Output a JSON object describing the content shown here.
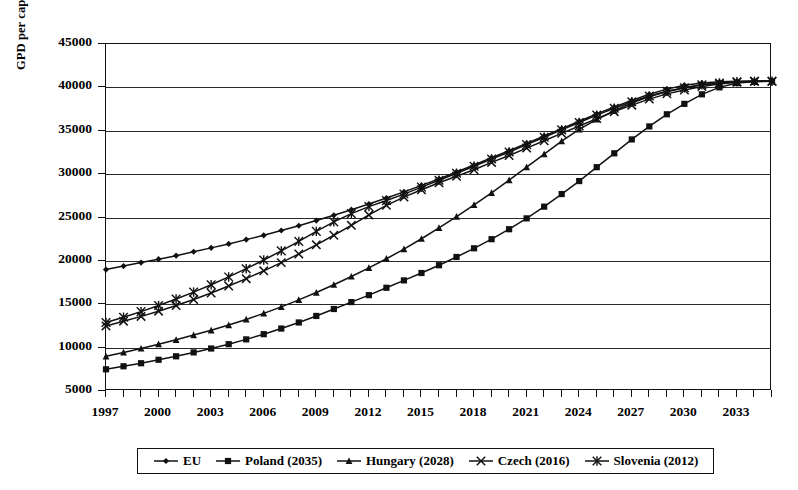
{
  "chart_data": {
    "type": "line",
    "title": "",
    "xlabel": "",
    "ylabel": "GPD per capita at PPP (US$)",
    "ylim": [
      5000,
      45000
    ],
    "xlim": [
      1997,
      2035
    ],
    "ytick_labels": [
      "45000",
      "40000",
      "35000",
      "30000",
      "25000",
      "20000",
      "15000",
      "10000",
      "5000"
    ],
    "ytick_values": [
      45000,
      40000,
      35000,
      30000,
      25000,
      20000,
      15000,
      10000,
      5000
    ],
    "xtick_labels": [
      "1997",
      "2000",
      "2003",
      "2006",
      "2009",
      "2012",
      "2015",
      "2018",
      "2021",
      "2024",
      "2027",
      "2030",
      "2033"
    ],
    "xtick_values": [
      1997,
      2000,
      2003,
      2006,
      2009,
      2012,
      2015,
      2018,
      2021,
      2024,
      2027,
      2030,
      2033
    ],
    "x": [
      1997,
      1998,
      1999,
      2000,
      2001,
      2002,
      2003,
      2004,
      2005,
      2006,
      2007,
      2008,
      2009,
      2010,
      2011,
      2012,
      2013,
      2014,
      2015,
      2016,
      2017,
      2018,
      2019,
      2020,
      2021,
      2022,
      2023,
      2024,
      2025,
      2026,
      2027,
      2028,
      2029,
      2030,
      2031,
      2032,
      2033,
      2034,
      2035
    ],
    "grid": true,
    "legend_position": "bottom",
    "series": [
      {
        "name": "EU",
        "marker": "diamond",
        "values": [
          19000,
          19400,
          19800,
          20200,
          20600,
          21050,
          21500,
          21950,
          22450,
          22950,
          23500,
          24050,
          24650,
          25250,
          25900,
          26550,
          27250,
          27950,
          28700,
          29450,
          30250,
          31050,
          31900,
          32700,
          33550,
          34400,
          35250,
          36100,
          36950,
          37750,
          38500,
          39200,
          39800,
          40250,
          40500,
          40650,
          40700,
          40700,
          40700
        ]
      },
      {
        "name": "Poland (2035)",
        "marker": "square",
        "values": [
          7500,
          7850,
          8200,
          8600,
          9000,
          9450,
          9900,
          10400,
          10950,
          11550,
          12200,
          12900,
          13650,
          14450,
          15250,
          16050,
          16900,
          17750,
          18600,
          19500,
          20450,
          21450,
          22500,
          23650,
          24900,
          26250,
          27700,
          29200,
          30800,
          32400,
          34000,
          35500,
          36900,
          38100,
          39200,
          40000,
          40500,
          40650,
          40700
        ]
      },
      {
        "name": "Hungary (2028)",
        "marker": "triangle",
        "values": [
          9000,
          9450,
          9900,
          10400,
          10900,
          11450,
          12000,
          12600,
          13250,
          13950,
          14700,
          15500,
          16350,
          17250,
          18200,
          19200,
          20250,
          21350,
          22550,
          23800,
          25100,
          26450,
          27850,
          29300,
          30800,
          32300,
          33800,
          35150,
          36300,
          37300,
          38200,
          38950,
          39500,
          39950,
          40300,
          40500,
          40650,
          40700,
          40700
        ]
      },
      {
        "name": "Czech (2016)",
        "marker": "cross",
        "values": [
          12500,
          13050,
          13600,
          14200,
          14850,
          15550,
          16300,
          17100,
          17950,
          18850,
          19800,
          20800,
          21850,
          22950,
          24100,
          25300,
          26400,
          27350,
          28200,
          29000,
          29750,
          30500,
          31350,
          32150,
          33000,
          33850,
          34700,
          35550,
          36400,
          37200,
          37950,
          38650,
          39250,
          39700,
          40100,
          40400,
          40600,
          40700,
          40700
        ]
      },
      {
        "name": "Slovenia (2012)",
        "marker": "asterisk",
        "values": [
          12900,
          13500,
          14150,
          14850,
          15600,
          16400,
          17250,
          18150,
          19100,
          20100,
          21150,
          22250,
          23400,
          24500,
          25450,
          26250,
          26950,
          27700,
          28500,
          29300,
          30100,
          30900,
          31750,
          32550,
          33400,
          34250,
          35100,
          35950,
          36800,
          37600,
          38350,
          39000,
          39550,
          39950,
          40300,
          40500,
          40650,
          40700,
          40700
        ]
      }
    ]
  },
  "legend": {
    "items": [
      {
        "label": "EU",
        "marker": "diamond"
      },
      {
        "label": "Poland (2035)",
        "marker": "square"
      },
      {
        "label": "Hungary (2028)",
        "marker": "triangle"
      },
      {
        "label": "Czech (2016)",
        "marker": "cross"
      },
      {
        "label": "Slovenia (2012)",
        "marker": "asterisk"
      }
    ]
  }
}
